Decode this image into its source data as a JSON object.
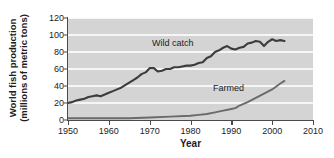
{
  "chart_data": {
    "type": "line",
    "title": "",
    "xlabel": "Year",
    "ylabel": "World fish production (millions of metric tons)",
    "ylabel_line1": "World fish production",
    "ylabel_line2": "(millions of metric tons)",
    "xlim": [
      1950,
      2010
    ],
    "ylim": [
      0,
      120
    ],
    "xticks": [
      1950,
      1960,
      1970,
      1980,
      1990,
      2000,
      2010
    ],
    "yticks": [
      0,
      20,
      40,
      60,
      80,
      100,
      120
    ],
    "grid": "horizontal",
    "legend_position": "inline-annotations",
    "plot_background": "#d4d4d4",
    "gridline_color": "#f6f6f6",
    "line_color": "#4a4a4a",
    "series": [
      {
        "name": "Wild catch",
        "label_text": "Wild catch",
        "color": "#3c3c3c",
        "x": [
          1950,
          1951,
          1952,
          1953,
          1954,
          1955,
          1956,
          1957,
          1958,
          1959,
          1960,
          1961,
          1962,
          1963,
          1964,
          1965,
          1966,
          1967,
          1968,
          1969,
          1970,
          1971,
          1972,
          1973,
          1974,
          1975,
          1976,
          1977,
          1978,
          1979,
          1980,
          1981,
          1982,
          1983,
          1984,
          1985,
          1986,
          1987,
          1988,
          1989,
          1990,
          1991,
          1992,
          1993,
          1994,
          1995,
          1996,
          1997,
          1998,
          1999,
          2000,
          2001,
          2002,
          2003
        ],
        "values": [
          20,
          21,
          23,
          24,
          25,
          27,
          28,
          29,
          28,
          30,
          32,
          34,
          36,
          38,
          41,
          44,
          47,
          50,
          54,
          56,
          61,
          61,
          57,
          58,
          60,
          60,
          62,
          62,
          63,
          64,
          64,
          65,
          67,
          68,
          73,
          75,
          80,
          82,
          85,
          87,
          84,
          83,
          85,
          86,
          90,
          91,
          93,
          92,
          87,
          92,
          95,
          93,
          94,
          93
        ]
      },
      {
        "name": "Farmed",
        "label_text": "Farmed",
        "color": "#6a6a6a",
        "x": [
          1950,
          1955,
          1960,
          1965,
          1970,
          1975,
          1980,
          1982,
          1984,
          1986,
          1988,
          1990,
          1991,
          1992,
          1994,
          1996,
          1998,
          2000,
          2002,
          2003
        ],
        "values": [
          2,
          2,
          2,
          2,
          3,
          4,
          5,
          6,
          7,
          9,
          11,
          13,
          14,
          17,
          21,
          26,
          31,
          36,
          43,
          46
        ]
      }
    ]
  }
}
